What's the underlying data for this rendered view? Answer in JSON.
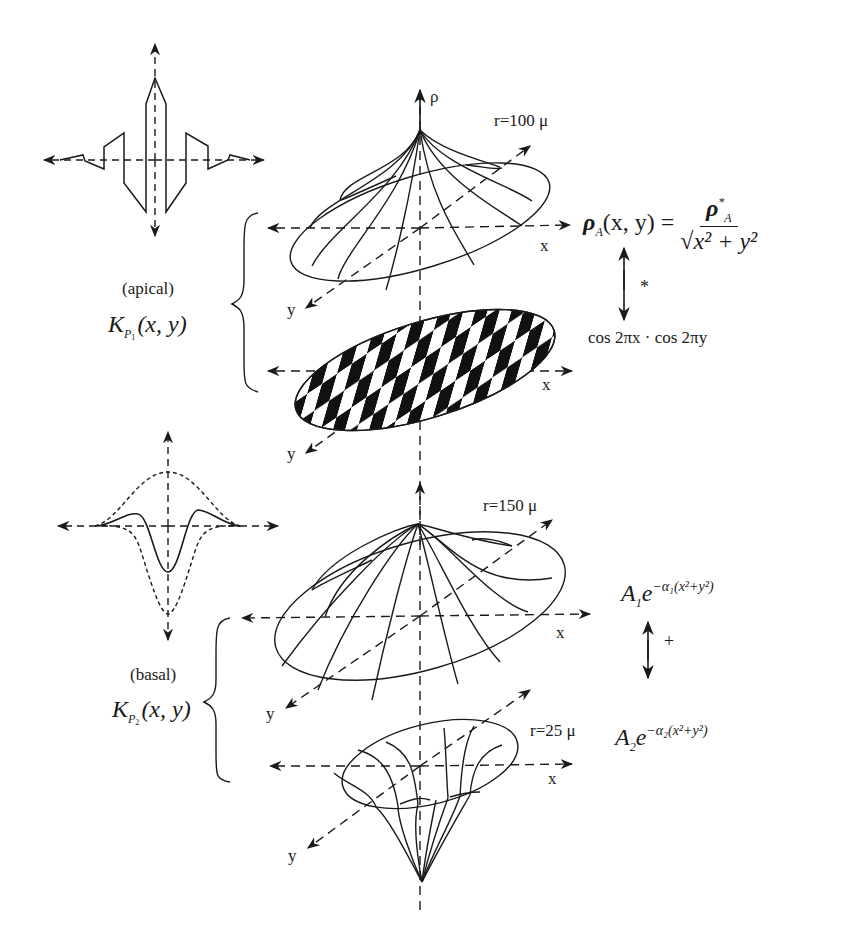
{
  "figure": {
    "apical": {
      "region_label": "(apical)",
      "kernel_label": "K",
      "kernel_sub": "P",
      "kernel_subsub": "1",
      "kernel_args": "(x, y)",
      "surface": {
        "radius_label": "r=100 μ",
        "vertical_axis_label": "ρ",
        "x_axis_label": "x",
        "y_axis_label": "y"
      },
      "checker": {
        "x_axis_label": "x",
        "y_axis_label": "y"
      },
      "formula_top": {
        "lhs": "ρ",
        "lhs_sub": "A",
        "lhs_args": "(x, y) =",
        "numerator": "ρ",
        "numerator_sub": "A",
        "numerator_sup": "*",
        "denominator": "√x² + y²"
      },
      "operator": "*",
      "formula_bottom": "cos 2πx · cos 2πy"
    },
    "basal": {
      "region_label": "(basal)",
      "kernel_label": "K",
      "kernel_sub": "P",
      "kernel_subsub": "2",
      "kernel_args": "(x, y)",
      "surface_outer": {
        "radius_label": "r=150 μ",
        "x_axis_label": "x",
        "y_axis_label": "y"
      },
      "surface_inner": {
        "radius_label": "r=25 μ",
        "x_axis_label": "x",
        "y_axis_label": "y"
      },
      "formula_top": {
        "coef": "A",
        "coef_sub": "1",
        "base": "e",
        "exponent": "−α₁(x²+y²)"
      },
      "operator": "+",
      "formula_bottom": {
        "coef": "A",
        "coef_sub": "2",
        "base": "e",
        "exponent": "−α₂(x²+y²)"
      }
    },
    "colors": {
      "ink": "#1a1a1a",
      "background": "#ffffff"
    }
  }
}
